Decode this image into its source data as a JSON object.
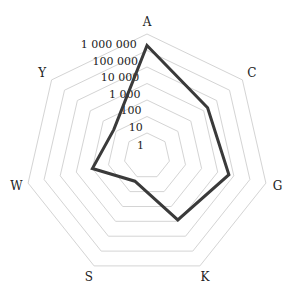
{
  "chart_data": {
    "type": "radar",
    "title": "",
    "scale": "log10",
    "categories": [
      "A",
      "C",
      "G",
      "K",
      "S",
      "W",
      "Y"
    ],
    "tick_labels": [
      "1",
      "10",
      "100",
      "1 000",
      "10 000",
      "100 000",
      "1 000 000"
    ],
    "tick_values": [
      1,
      10,
      100,
      1000,
      10000,
      100000,
      1000000
    ],
    "range": [
      1,
      1000000
    ],
    "grid": true,
    "legend": false,
    "series": [
      {
        "name": "series-1",
        "values": [
          200000,
          2000,
          5000,
          800,
          2,
          100,
          15
        ]
      }
    ],
    "colors": {
      "grid": "#d4d4d4",
      "line": "#3a3a3a",
      "text": "#222222"
    }
  }
}
